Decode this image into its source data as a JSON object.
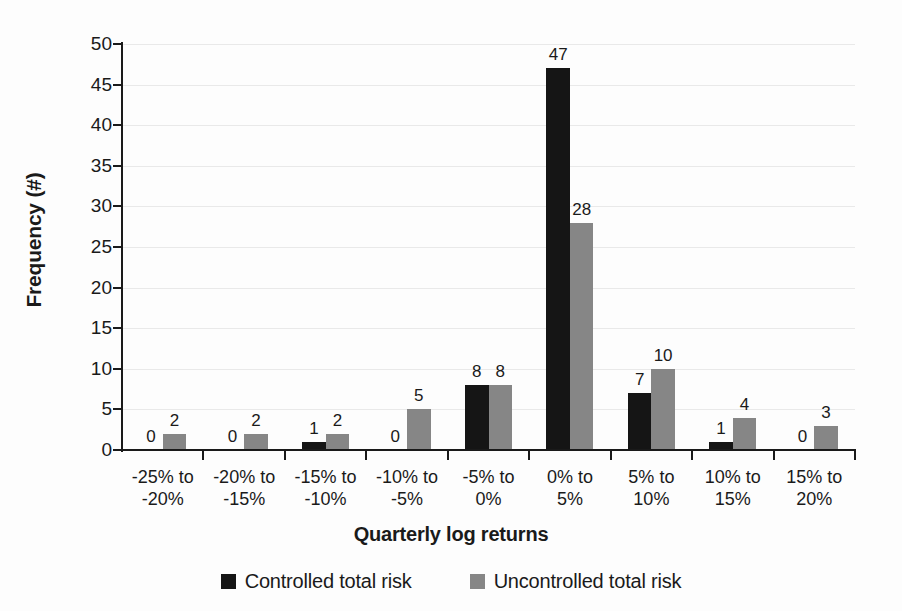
{
  "chart_data": {
    "type": "bar",
    "title": "",
    "xlabel": "Quarterly log returns",
    "ylabel": "Frequency (#)",
    "ylim": [
      0,
      50
    ],
    "ytick_step": 5,
    "yticks": [
      "0",
      "5",
      "10",
      "15",
      "20",
      "25",
      "30",
      "35",
      "40",
      "45",
      "50"
    ],
    "grid": "horizontal",
    "legend_position": "bottom-center",
    "data_labels": true,
    "categories": [
      "-25% to -20%",
      "-20% to -15%",
      "-15% to -10%",
      "-10% to -5%",
      "-5% to 0%",
      "0% to 5%",
      "5% to 10%",
      "10% to 15%",
      "15% to 20%"
    ],
    "category_lines": [
      [
        "-25% to",
        "-20%"
      ],
      [
        "-20% to",
        "-15%"
      ],
      [
        "-15% to",
        "-10%"
      ],
      [
        "-10% to",
        "-5%"
      ],
      [
        "-5% to",
        "0%"
      ],
      [
        "0% to",
        "5%"
      ],
      [
        "5% to",
        "10%"
      ],
      [
        "10% to",
        "15%"
      ],
      [
        "15% to",
        "20%"
      ]
    ],
    "series": [
      {
        "name": "Controlled total risk",
        "color": "#151515",
        "values": [
          0,
          0,
          1,
          0,
          8,
          47,
          7,
          1,
          0
        ]
      },
      {
        "name": "Uncontrolled total risk",
        "color": "#868686",
        "values": [
          2,
          2,
          2,
          5,
          8,
          28,
          10,
          4,
          3
        ]
      }
    ]
  },
  "colors": {
    "background": "#fdfdfd",
    "axis": "#1a1a1a",
    "grid": "#e9e9e9",
    "controlled": "#151515",
    "uncontrolled": "#868686"
  }
}
